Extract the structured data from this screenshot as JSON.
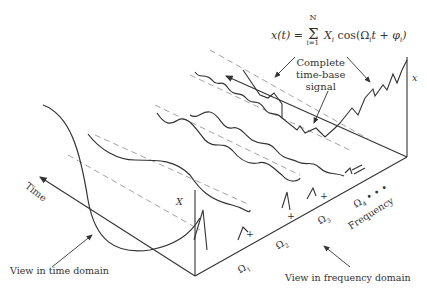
{
  "formula": {
    "lhs": "x(t) =",
    "sum_top": "N",
    "sum_symbol": "Σ",
    "sum_bottom": "i=1",
    "rhs": "X",
    "rhs_sub": "i",
    "rhs_rest": " cos(Ω",
    "omega_sub": "i",
    "rhs_end": "t + φ",
    "phi_sub": "i",
    "close": ")"
  },
  "labels": {
    "complete_signal": [
      "Complete",
      "time-base",
      "signal"
    ],
    "x_axis": "x",
    "amplitude": "X",
    "time_axis": "Time",
    "frequency_axis": "Frequency",
    "time_view": "View in time domain",
    "freq_view": "View in frequency domain"
  },
  "frequencies": [
    {
      "symbol": "Ω",
      "sub": "1"
    },
    {
      "symbol": "Ω",
      "sub": "2"
    },
    {
      "symbol": "Ω",
      "sub": "3"
    },
    {
      "symbol": "Ω",
      "sub": "4",
      "suffix": " • • •"
    }
  ],
  "markers": [
    "+",
    "+",
    "+"
  ]
}
